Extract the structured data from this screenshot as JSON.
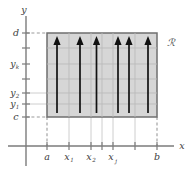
{
  "figure": {
    "background_color": "#ffffff",
    "region_fill_color": "#cfcfcf",
    "region_border_color": "#6f6f6f",
    "grid_color": "#b9b9b9",
    "axis_color": "#7b7b7b",
    "arrow_color": "#111111",
    "label_color": "#3d3d3d"
  },
  "axes": {
    "x_axis_label": "x",
    "y_axis_label": "y",
    "x_ticks": [
      {
        "label": "a",
        "sub": "",
        "x": 47
      },
      {
        "label": "x",
        "sub": "1",
        "x": 69
      },
      {
        "label": "x",
        "sub": "2",
        "x": 91
      },
      {
        "label": "",
        "sub": "",
        "x": 102
      },
      {
        "label": "x",
        "sub": "j",
        "x": 113
      },
      {
        "label": "",
        "sub": "",
        "x": 135
      },
      {
        "label": "b",
        "sub": "",
        "x": 157
      }
    ],
    "y_ticks": [
      {
        "label": "d",
        "sub": "",
        "y": 33
      },
      {
        "label": "",
        "sub": "",
        "y": 48
      },
      {
        "label": "y",
        "sub": "k",
        "y": 64
      },
      {
        "label": "",
        "sub": "",
        "y": 79
      },
      {
        "label": "y",
        "sub": "2",
        "y": 93
      },
      {
        "label": "y",
        "sub": "1",
        "y": 104
      },
      {
        "label": "c",
        "sub": "",
        "y": 117
      }
    ]
  },
  "region": {
    "name": "R",
    "label": "ℛ",
    "left": 47,
    "right": 157,
    "top": 33,
    "bottom": 117,
    "label_x": 166,
    "label_y": 43
  },
  "grid": {
    "vertical_x": [
      69,
      91,
      102,
      113,
      135
    ],
    "horizontal_y": [
      48,
      64,
      79,
      93,
      104
    ]
  },
  "arrows": {
    "count": 6,
    "x_positions": [
      57,
      80,
      96.5,
      107.5,
      124,
      146
    ],
    "tail_y": 113,
    "tip_y": 38
  },
  "dashes": {
    "d_line": {
      "x1": 26,
      "x2": 47,
      "y": 33
    },
    "c_line": {
      "x1": 26,
      "x2": 47,
      "y": 117
    },
    "a_line": {
      "x": 47,
      "y1": 117,
      "y2": 145
    },
    "b_line": {
      "x": 157,
      "y1": 117,
      "y2": 145
    }
  }
}
